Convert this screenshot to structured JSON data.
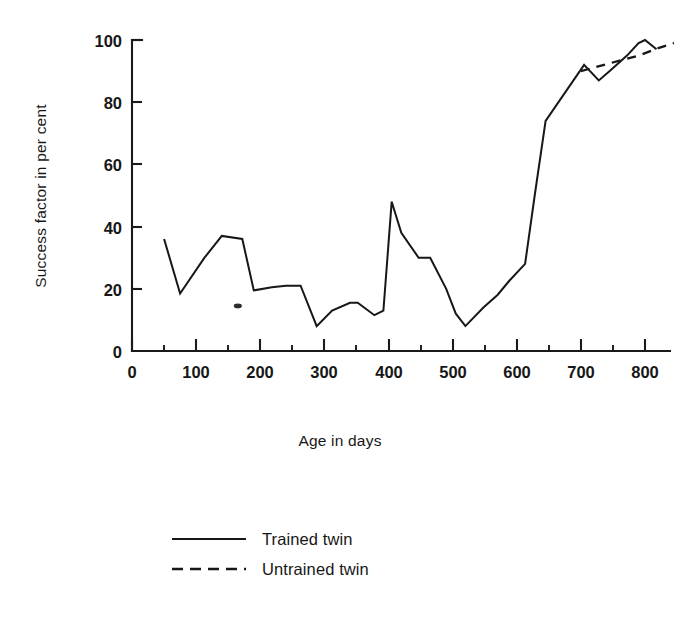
{
  "chart_data": {
    "type": "line",
    "title": "",
    "xlabel": "Age in days",
    "ylabel": "Success factor in per cent",
    "xlim": [
      0,
      845
    ],
    "ylim": [
      0,
      100
    ],
    "xticks": [
      0,
      100,
      200,
      300,
      400,
      500,
      600,
      700,
      800
    ],
    "xtick_labels": [
      "0",
      "100",
      "200",
      "300",
      "400",
      "500",
      "600",
      "700",
      "800"
    ],
    "xminor_step": 50,
    "yticks": [
      0,
      20,
      40,
      60,
      80,
      100
    ],
    "ytick_labels": [
      "0",
      "20",
      "40",
      "60",
      "80",
      "100"
    ],
    "grid": false,
    "legend_position": "below-center",
    "series": [
      {
        "name": "Trained twin",
        "style": "solid",
        "x": [
          50,
          75,
          113,
          140,
          172,
          190,
          218,
          240,
          263,
          288,
          312,
          340,
          352,
          378,
          392,
          405,
          420,
          447,
          465,
          490,
          505,
          520,
          548,
          570,
          588,
          613,
          628,
          645,
          705,
          728,
          745,
          772,
          790,
          800,
          818
        ],
        "y": [
          36,
          18.5,
          30,
          37,
          36,
          19.5,
          20.5,
          21,
          21,
          8,
          13,
          15.5,
          15.5,
          11.5,
          13,
          48,
          38,
          30,
          30,
          20,
          12,
          8,
          14,
          18,
          22.5,
          28,
          50,
          74,
          92,
          87,
          90,
          95,
          99,
          100,
          97
        ]
      },
      {
        "name": "Untrained twin",
        "style": "dashed",
        "x": [
          700,
          745,
          790,
          822,
          845
        ],
        "y": [
          90,
          92.5,
          95,
          97.5,
          99
        ]
      }
    ],
    "annotations": [
      {
        "kind": "ink-speck",
        "x": 165,
        "y": 14.5
      }
    ]
  },
  "legend": {
    "items": [
      {
        "label": "Trained twin",
        "style": "solid"
      },
      {
        "label": "Untrained twin",
        "style": "dashed"
      }
    ]
  }
}
